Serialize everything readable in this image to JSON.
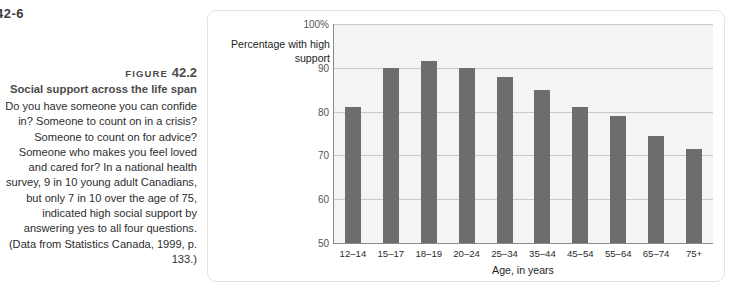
{
  "page": {
    "running_head": "42-6"
  },
  "caption": {
    "figure_word": "FIGURE",
    "figure_number": "42.2",
    "title": "Social support across the life span",
    "body": "Do you have someone you can confide in? Someone to count on in a crisis? Someone to count on for advice? Someone who makes you feel loved and cared for? In a national health survey, 9 in 10 young adult Canadians, but only 7 in 10 over the age of 75, indicated high social support by answering yes to all four questions. (Data from Statistics Canada, 1999, p. 133.)"
  },
  "chart_data": {
    "type": "bar",
    "title": "Social support across the life span",
    "xlabel": "Age, in years",
    "ylabel": "Percentage with high support",
    "categories": [
      "12–14",
      "15–17",
      "18–19",
      "20–24",
      "25–34",
      "35–44",
      "45–54",
      "55–64",
      "65–74",
      "75+"
    ],
    "values": [
      81,
      90,
      91.5,
      90,
      88,
      85,
      81,
      79,
      74.5,
      71.5
    ],
    "ylim": [
      50,
      100
    ],
    "ytick_labels": [
      "100%",
      "90",
      "80",
      "70",
      "60",
      "50"
    ],
    "ytick_values": [
      100,
      90,
      80,
      70,
      60,
      50
    ],
    "grid": true,
    "legend": "none",
    "bar_color": "#6d6d6d",
    "plot_background": "#f4f4f4",
    "gridline_color": "#c9c9c9",
    "axis_color": "#8a8a8a"
  }
}
